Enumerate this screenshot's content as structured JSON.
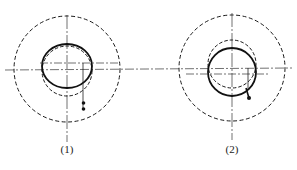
{
  "figures": [
    {
      "id": "fig1",
      "label": "(1)",
      "description": "Outer dashed circle with solid ellipse offset upward and dashed inner circle offset downward; weight on a vertical line hanging from right side"
    },
    {
      "id": "fig2",
      "label": "(2)",
      "description": "Outer dashed circle with dashed inner circle offset upward and solid circle offset downward; weight hanging near lower right of solid circle"
    }
  ],
  "colors": {
    "stroke": "#1a1a1a",
    "background": "#ffffff"
  }
}
